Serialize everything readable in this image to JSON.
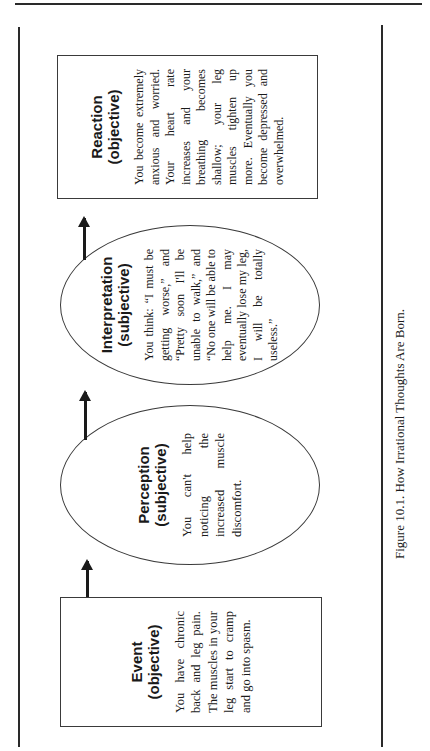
{
  "page": {
    "bleed_through_text": "tress. Did my pain a"
  },
  "figure": {
    "caption": "Figure 10.1.  How Irrational Thoughts Are Born.",
    "nodes": [
      {
        "id": "event",
        "shape": "box",
        "title": "Event",
        "subtitle": "(objective)",
        "text": "You have chronic back and leg pain. The muscles in your leg start to cramp and go into spasm."
      },
      {
        "id": "perception",
        "shape": "ellipse",
        "title": "Perception",
        "subtitle": "(subjective)",
        "text": "You can't help noticing the increased muscle discomfort."
      },
      {
        "id": "interpretation",
        "shape": "ellipse",
        "title": "Interpretation",
        "subtitle": "(subjective)",
        "text": "You think: “I must be getting worse,” and “Pretty soon I'll be unable to walk,” and “No one will be able to help me. I may eventually lose my leg, I will be totally useless.”"
      },
      {
        "id": "reaction",
        "shape": "box",
        "title": "Reaction",
        "subtitle": "(objective)",
        "text": "You become extremely anxious and worried. Your heart rate increases and your breathing becomes shallow; your leg muscles tighten up more. Eventually you become depressed and overwhelmed."
      }
    ],
    "arrows": [
      {
        "from": "event",
        "to": "perception"
      },
      {
        "from": "perception",
        "to": "interpretation"
      },
      {
        "from": "interpretation",
        "to": "reaction"
      }
    ]
  }
}
